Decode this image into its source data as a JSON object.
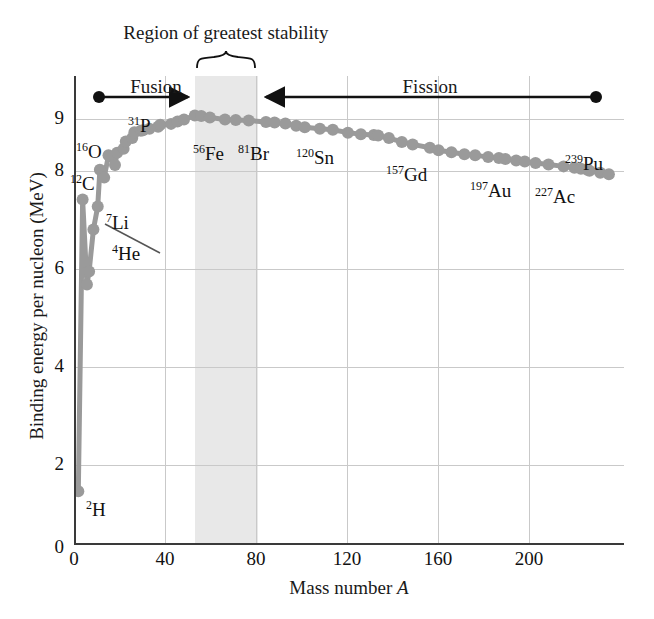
{
  "chart_data": {
    "type": "scatter",
    "title": "",
    "xlabel": "Mass number A",
    "ylabel": "Binding energy per nucleon (MeV)",
    "xlim": [
      0,
      255
    ],
    "ylim": [
      0,
      9.6
    ],
    "xticks": [
      0,
      40,
      80,
      120,
      160,
      200
    ],
    "yticks": [
      0,
      2,
      4,
      6,
      8,
      9
    ],
    "grid": true,
    "legend": "none",
    "series": [
      {
        "name": "Binding energy per nucleon",
        "x": [
          2,
          4,
          6,
          7,
          9,
          11,
          12,
          14,
          16,
          19,
          20,
          23,
          24,
          27,
          28,
          31,
          32,
          35,
          39,
          40,
          45,
          48,
          51,
          56,
          59,
          63,
          70,
          75,
          81,
          89,
          93,
          98,
          103,
          107,
          114,
          120,
          127,
          133,
          139,
          141,
          146,
          152,
          157,
          165,
          169,
          175,
          181,
          186,
          192,
          197,
          200,
          205,
          209,
          214,
          220,
          227,
          232,
          235,
          238,
          239,
          244,
          248
        ],
        "y": [
          1.1,
          7.07,
          5.33,
          5.6,
          6.46,
          6.93,
          7.68,
          7.52,
          7.98,
          7.78,
          8.03,
          8.11,
          8.26,
          8.33,
          8.45,
          8.48,
          8.49,
          8.52,
          8.56,
          8.6,
          8.62,
          8.67,
          8.71,
          8.79,
          8.78,
          8.75,
          8.71,
          8.7,
          8.69,
          8.66,
          8.65,
          8.63,
          8.58,
          8.55,
          8.52,
          8.5,
          8.44,
          8.41,
          8.39,
          8.38,
          8.33,
          8.25,
          8.2,
          8.13,
          8.08,
          8.04,
          8.0,
          7.98,
          7.94,
          7.92,
          7.9,
          7.87,
          7.85,
          7.82,
          7.79,
          7.75,
          7.72,
          7.7,
          7.68,
          7.66,
          7.62,
          7.59
        ]
      }
    ],
    "point_color": "#9a9a9a",
    "line_color": "#9a9a9a",
    "band_color": "#e4e4e4",
    "grid_color": "#c9c9c9",
    "axis_color": "#3a3a3a",
    "annotations": {
      "region_label": "Region of greatest stability",
      "fusion_label": "Fusion",
      "fission_label": "Fission",
      "band_range": [
        54,
        82
      ]
    },
    "point_labels": [
      {
        "id": "H2",
        "mass": "2",
        "symbol": "H",
        "x": 2,
        "y": 1.1
      },
      {
        "id": "He4",
        "mass": "4",
        "symbol": "He",
        "x": 4,
        "y": 7.07
      },
      {
        "id": "Li7",
        "mass": "7",
        "symbol": "Li",
        "x": 7,
        "y": 5.6
      },
      {
        "id": "C12",
        "mass": "12",
        "symbol": "C",
        "x": 12,
        "y": 7.68
      },
      {
        "id": "O16",
        "mass": "16",
        "symbol": "O",
        "x": 16,
        "y": 7.98
      },
      {
        "id": "P31",
        "mass": "31",
        "symbol": "P",
        "x": 31,
        "y": 8.48
      },
      {
        "id": "Fe56",
        "mass": "56",
        "symbol": "Fe",
        "x": 56,
        "y": 8.79
      },
      {
        "id": "Br81",
        "mass": "81",
        "symbol": "Br",
        "x": 81,
        "y": 8.69
      },
      {
        "id": "Sn120",
        "mass": "120",
        "symbol": "Sn",
        "x": 120,
        "y": 8.5
      },
      {
        "id": "Gd157",
        "mass": "157",
        "symbol": "Gd",
        "x": 157,
        "y": 8.2
      },
      {
        "id": "Au197",
        "mass": "197",
        "symbol": "Au",
        "x": 197,
        "y": 7.92
      },
      {
        "id": "Ac227",
        "mass": "227",
        "symbol": "Ac",
        "x": 227,
        "y": 7.75
      },
      {
        "id": "Pu239",
        "mass": "239",
        "symbol": "Pu",
        "x": 239,
        "y": 7.66
      }
    ]
  },
  "axes": {
    "y_title": "Binding energy per nucleon (MeV)",
    "x_title_text": "Mass number ",
    "x_title_var": "A",
    "yticks": [
      "0",
      "2",
      "4",
      "6",
      "8",
      "9"
    ],
    "xticks": [
      "0",
      "40",
      "80",
      "120",
      "160",
      "200"
    ]
  },
  "annotations": {
    "region": "Region of greatest stability",
    "fusion": "Fusion",
    "fission": "Fission"
  },
  "labels": {
    "H2": {
      "mass": "2",
      "symbol": "H"
    },
    "He4": {
      "mass": "4",
      "symbol": "He"
    },
    "Li7": {
      "mass": "7",
      "symbol": "Li"
    },
    "C12": {
      "mass": "12",
      "symbol": "C"
    },
    "O16": {
      "mass": "16",
      "symbol": "O"
    },
    "P31": {
      "mass": "31",
      "symbol": "P"
    },
    "Fe56": {
      "mass": "56",
      "symbol": "Fe"
    },
    "Br81": {
      "mass": "81",
      "symbol": "Br"
    },
    "Sn120": {
      "mass": "120",
      "symbol": "Sn"
    },
    "Gd157": {
      "mass": "157",
      "symbol": "Gd"
    },
    "Au197": {
      "mass": "197",
      "symbol": "Au"
    },
    "Ac227": {
      "mass": "227",
      "symbol": "Ac"
    },
    "Pu239": {
      "mass": "239",
      "symbol": "Pu"
    }
  }
}
